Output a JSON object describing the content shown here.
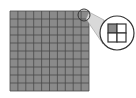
{
  "diagram": {
    "type": "magnified-grid",
    "grid": {
      "rows": 10,
      "cols": 10,
      "cell_fill": "#8a8a8a",
      "line_color": "#4a4a4a"
    },
    "magnifier": {
      "small_circle": {
        "cx": 84,
        "cy": 15,
        "r": 6
      },
      "large_circle": {
        "cx": 117,
        "cy": 33,
        "r": 17
      },
      "detail_grid": {
        "rows": 2,
        "cols": 2,
        "highlighted_cell": "top-left",
        "highlight_fill": "#8a8a8a",
        "other_fill": "#ffffff"
      }
    },
    "colors": {
      "beam": "#d9d9d9",
      "stroke": "#333333",
      "background": "#ffffff"
    }
  }
}
